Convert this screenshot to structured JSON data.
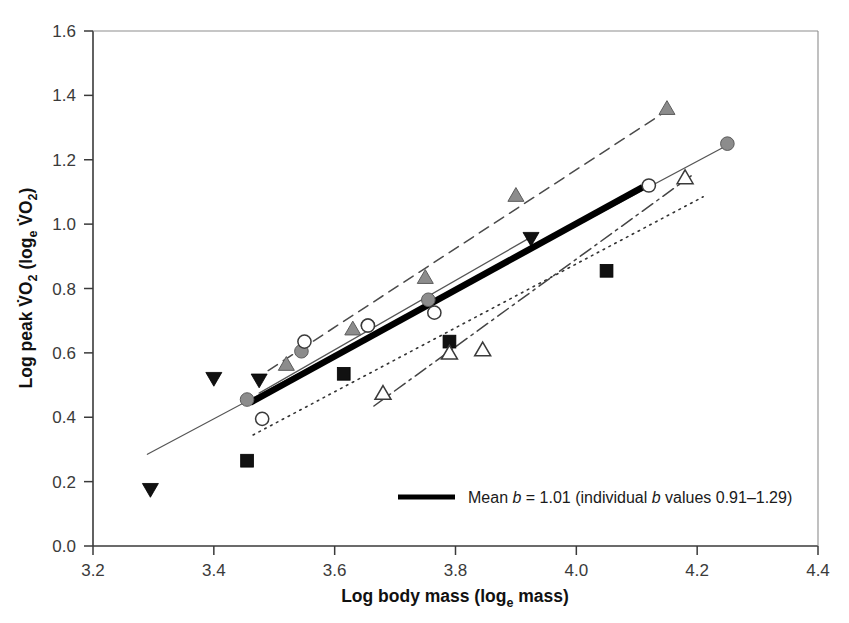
{
  "chart_data": {
    "type": "scatter",
    "title": "",
    "xlabel": "Log body mass (log_e mass)",
    "ylabel": "Log peak VO2 (log_e VO2)",
    "xlabel_parts": {
      "main": "Log body mass (log",
      "sub": "e",
      "tail": " mass)"
    },
    "ylabel_parts": {
      "main": "Log peak V̇O",
      "sub1": "2",
      "mid": " (log",
      "sub2": "e",
      "mid2": " V̇O",
      "sub3": "2",
      "tail": ")"
    },
    "xlim": [
      3.2,
      4.4
    ],
    "ylim": [
      0.0,
      1.6
    ],
    "xticks": [
      "3.2",
      "3.4",
      "3.6",
      "3.8",
      "4.0",
      "4.2",
      "4.4"
    ],
    "yticks": [
      "0.0",
      "0.2",
      "0.4",
      "0.6",
      "0.8",
      "1.0",
      "1.2",
      "1.4",
      "1.6"
    ],
    "xtick_values": [
      3.2,
      3.4,
      3.6,
      3.8,
      4.0,
      4.2,
      4.4
    ],
    "ytick_values": [
      0.0,
      0.2,
      0.4,
      0.6,
      0.8,
      1.0,
      1.2,
      1.4,
      1.6
    ],
    "grid": false,
    "legend_position": "bottom-center",
    "series": [
      {
        "name": "gray-triangle-series",
        "marker": "triangle-up-filled",
        "marker_color": "#8c8c8c",
        "line_style": "dashed",
        "line_color": "#4a4a4a",
        "points": [
          {
            "x": 3.52,
            "y": 0.565
          },
          {
            "x": 3.63,
            "y": 0.675
          },
          {
            "x": 3.75,
            "y": 0.835
          },
          {
            "x": 3.9,
            "y": 1.09
          },
          {
            "x": 4.15,
            "y": 1.36
          }
        ],
        "fit_line": {
          "x1": 3.49,
          "y1": 0.545,
          "x2": 4.16,
          "y2": 1.365
        }
      },
      {
        "name": "gray-circle-series",
        "marker": "circle-filled",
        "marker_color": "#8c8c8c",
        "line_style": "solid-thin",
        "line_color": "#555555",
        "points": [
          {
            "x": 3.455,
            "y": 0.455
          },
          {
            "x": 3.545,
            "y": 0.605
          },
          {
            "x": 3.655,
            "y": 0.685
          },
          {
            "x": 3.755,
            "y": 0.765
          },
          {
            "x": 4.25,
            "y": 1.25
          }
        ],
        "fit_line": {
          "x1": 3.29,
          "y1": 0.285,
          "x2": 4.26,
          "y2": 1.255
        }
      },
      {
        "name": "open-circle-series",
        "marker": "circle-open",
        "marker_color": "#ffffff",
        "line_style": "solid-thin",
        "line_color": "#555555",
        "points": [
          {
            "x": 3.48,
            "y": 0.395
          },
          {
            "x": 3.55,
            "y": 0.635
          },
          {
            "x": 3.655,
            "y": 0.685
          },
          {
            "x": 3.765,
            "y": 0.725
          },
          {
            "x": 4.12,
            "y": 1.12
          }
        ],
        "fit_line": {
          "x1": 3.475,
          "y1": 0.475,
          "x2": 3.93,
          "y2": 0.965
        }
      },
      {
        "name": "black-triangle-down-series",
        "marker": "triangle-down-filled",
        "marker_color": "#111111",
        "line_style": "none",
        "line_color": "#111111",
        "points": [
          {
            "x": 3.295,
            "y": 0.175
          },
          {
            "x": 3.4,
            "y": 0.52
          },
          {
            "x": 3.475,
            "y": 0.515
          },
          {
            "x": 3.925,
            "y": 0.955
          }
        ],
        "fit_line": null
      },
      {
        "name": "black-square-series",
        "marker": "square-filled",
        "marker_color": "#111111",
        "line_style": "dotted",
        "line_color": "#333333",
        "points": [
          {
            "x": 3.455,
            "y": 0.265
          },
          {
            "x": 3.615,
            "y": 0.535
          },
          {
            "x": 3.79,
            "y": 0.635
          },
          {
            "x": 4.05,
            "y": 0.855
          }
        ],
        "fit_line": {
          "x1": 3.465,
          "y1": 0.345,
          "x2": 4.21,
          "y2": 1.085
        }
      },
      {
        "name": "open-triangle-series",
        "marker": "triangle-up-open",
        "marker_color": "#ffffff",
        "line_style": "dash-dot",
        "line_color": "#444444",
        "points": [
          {
            "x": 3.68,
            "y": 0.475
          },
          {
            "x": 3.79,
            "y": 0.6
          },
          {
            "x": 3.845,
            "y": 0.61
          },
          {
            "x": 4.18,
            "y": 1.145
          }
        ],
        "fit_line": {
          "x1": 3.665,
          "y1": 0.435,
          "x2": 4.19,
          "y2": 1.15
        }
      },
      {
        "name": "mean-regression",
        "marker": "none",
        "marker_color": "#000000",
        "line_style": "thick-solid",
        "line_color": "#000000",
        "points": [],
        "fit_line": {
          "x1": 3.46,
          "y1": 0.445,
          "x2": 4.11,
          "y2": 1.115
        }
      }
    ],
    "annotations": [
      {
        "text": "Mean b = 1.01 (individual b values 0.91–1.29)",
        "type": "legend-entry"
      }
    ]
  },
  "legend": {
    "swatch_name": "mean-line-swatch",
    "prefix": "Mean ",
    "italic_b1": "b",
    "middle": " = 1.01 (individual ",
    "italic_b2": "b",
    "suffix": " values 0.91–1.29)"
  },
  "axes": {
    "x_title_main": "Log body mass (log",
    "x_title_sub": "e",
    "x_title_tail": " mass)",
    "y_title_a": "Log peak V",
    "y_title_o1": "O",
    "y_title_sub1": "2",
    "y_title_b": " (log",
    "y_title_sub2": "e",
    "y_title_c": " V",
    "y_title_o2": "O",
    "y_title_sub3": "2",
    "y_title_d": ")"
  },
  "colors": {
    "axis": "#3a3a3a",
    "marker_gray": "#8c8c8c",
    "marker_black": "#111111",
    "mean_line": "#000000",
    "background": "#ffffff"
  }
}
